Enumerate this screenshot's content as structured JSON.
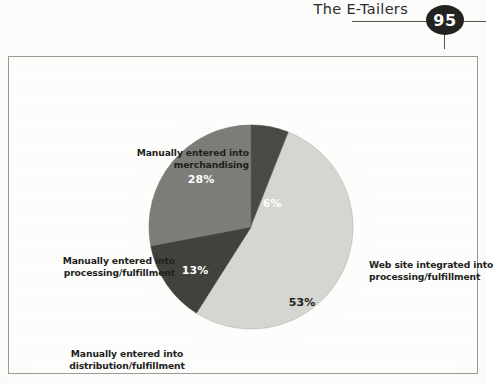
{
  "header": {
    "title": "The E-Tailers",
    "page_number": "95"
  },
  "figure": {
    "labels": {
      "merchandising": "Manually entered into\nmerchandising",
      "processing": "Manually entered into\nprocessing/fulfillment",
      "distribution": "Manually entered into\ndistribution/fulfillment",
      "website": "Web site integrated into\nprocessing/fulfillment"
    },
    "value_labels": {
      "s6": "6%",
      "s53": "53%",
      "s13": "13%",
      "s28": "28%"
    }
  },
  "chart_data": {
    "type": "pie",
    "title": "",
    "categories": [
      "Manually entered into merchandising",
      "Web site integrated into processing/fulfillment",
      "Manually entered into distribution/fulfillment",
      "Manually entered into processing/fulfillment"
    ],
    "values": [
      6,
      53,
      13,
      28
    ],
    "value_labels": [
      "6%",
      "53%",
      "13%",
      "28%"
    ],
    "colors": [
      "#4a4a47",
      "#d6d6d3",
      "#43433d",
      "#7d7d7a"
    ],
    "label_text_colors": [
      "#ffffff",
      "#1f1f1d",
      "#ffffff",
      "#ffffff"
    ],
    "start_angle_deg": 0,
    "direction": "clockwise",
    "legend": "callout labels around pie",
    "grid": false
  }
}
